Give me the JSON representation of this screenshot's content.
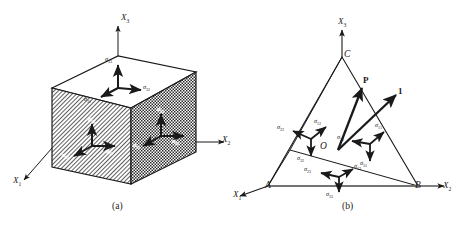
{
  "figure": {
    "panels": [
      {
        "id": "a",
        "caption": "(a)",
        "description": "Rectangular parallelepiped (cube) element showing stress components on three visible faces",
        "axes": [
          {
            "name": "X3",
            "label": "X",
            "sub": "3",
            "direction": "up"
          },
          {
            "name": "X2",
            "label": "X",
            "sub": "2",
            "direction": "right"
          },
          {
            "name": "X1",
            "label": "X",
            "sub": "1",
            "direction": "lower-left"
          }
        ],
        "faces": [
          {
            "name": "top-face",
            "normal": "X3",
            "components": [
              {
                "label": "σ",
                "sub": "33",
                "dir": "up"
              },
              {
                "label": "σ",
                "sub": "32",
                "dir": "right"
              },
              {
                "label": "σ",
                "sub": "31",
                "dir": "lower-left"
              }
            ]
          },
          {
            "name": "front-left-face",
            "normal": "X1",
            "hatch": "diagonal",
            "components": [
              {
                "label": "σ",
                "sub": "13",
                "dir": "up"
              },
              {
                "label": "σ",
                "sub": "12",
                "dir": "right"
              },
              {
                "label": "σ",
                "sub": "11",
                "dir": "lower-left"
              }
            ]
          },
          {
            "name": "right-face",
            "normal": "X2",
            "hatch": "checker",
            "components": [
              {
                "label": "σ",
                "sub": "23",
                "dir": "up"
              },
              {
                "label": "σ",
                "sub": "22",
                "dir": "right"
              },
              {
                "label": "σ",
                "sub": "21",
                "dir": "lower-left"
              }
            ]
          }
        ]
      },
      {
        "id": "b",
        "caption": "(b)",
        "description": "Cauchy tetrahedron OABC with traction vector P and unit normal 1 on the inclined face",
        "axes": [
          {
            "name": "X3",
            "label": "X",
            "sub": "3",
            "direction": "up"
          },
          {
            "name": "X2",
            "label": "X",
            "sub": "2",
            "direction": "right"
          },
          {
            "name": "X1",
            "label": "X",
            "sub": "1",
            "direction": "lower-left"
          }
        ],
        "vertices": [
          {
            "name": "O",
            "label": "O",
            "role": "origin"
          },
          {
            "name": "A",
            "label": "A",
            "role": "x1-intercept"
          },
          {
            "name": "B",
            "label": "B",
            "role": "x2-intercept"
          },
          {
            "name": "C",
            "label": "C",
            "role": "x3-intercept"
          }
        ],
        "vectors": [
          {
            "name": "traction-vector",
            "label": "P",
            "bold": true
          },
          {
            "name": "unit-normal-vector",
            "label": "1",
            "bold": true
          }
        ],
        "faces": [
          {
            "name": "left-face-OAC",
            "normal": "X2",
            "components": [
              {
                "label": "σ",
                "sub": "22",
                "dir": "left"
              },
              {
                "label": "σ",
                "sub": "12",
                "dir": "upper-right"
              },
              {
                "label": "σ",
                "sub": "32",
                "dir": "down"
              }
            ]
          },
          {
            "name": "right-face-OBC",
            "normal": "X1",
            "components": [
              {
                "label": "σ",
                "sub": "21",
                "dir": "left"
              },
              {
                "label": "σ",
                "sub": "11",
                "dir": "upper-right"
              },
              {
                "label": "σ",
                "sub": "31",
                "dir": "down"
              }
            ]
          },
          {
            "name": "bottom-face-OAB",
            "normal": "X3",
            "components": [
              {
                "label": "σ",
                "sub": "23",
                "dir": "left"
              },
              {
                "label": "σ",
                "sub": "13",
                "dir": "upper-right"
              },
              {
                "label": "σ",
                "sub": "33",
                "dir": "down"
              }
            ]
          }
        ]
      }
    ],
    "colors": {
      "line": "#1a1a1a",
      "background": "#ffffff",
      "hatch": "#3a3a3a"
    }
  }
}
